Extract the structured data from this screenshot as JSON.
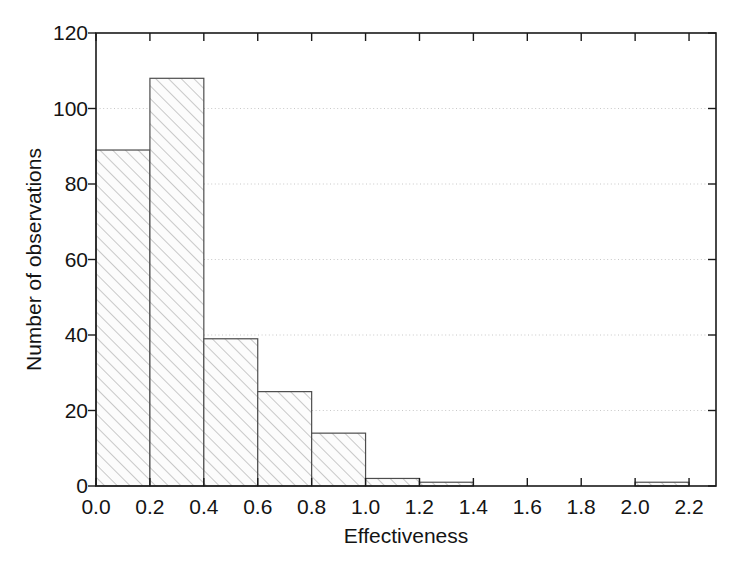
{
  "chart_data": {
    "type": "bar",
    "title": "",
    "subtitle": "",
    "xlabel": "Effectiveness",
    "ylabel": "Number of observations",
    "categories": [
      "0.0-0.2",
      "0.2-0.4",
      "0.4-0.6",
      "0.6-0.8",
      "0.8-1.0",
      "1.0-1.2",
      "1.2-1.4",
      "1.4-1.6",
      "1.6-1.8",
      "1.8-2.0",
      "2.0-2.2"
    ],
    "bin_edges": [
      0.0,
      0.2,
      0.4,
      0.6,
      0.8,
      1.0,
      1.2,
      1.4,
      1.6,
      1.8,
      2.0,
      2.2
    ],
    "bin_width": 0.2,
    "values": [
      89,
      108,
      39,
      25,
      14,
      2,
      1,
      0,
      0,
      0,
      1
    ],
    "xlim": [
      0.0,
      2.3
    ],
    "ylim": [
      0,
      120
    ],
    "xticks": [
      0.0,
      0.2,
      0.4,
      0.6,
      0.8,
      1.0,
      1.2,
      1.4,
      1.6,
      1.8,
      2.0,
      2.2
    ],
    "xtick_labels": [
      "0.0",
      "0.2",
      "0.4",
      "0.6",
      "0.8",
      "1.0",
      "1.2",
      "1.4",
      "1.6",
      "1.8",
      "2.0",
      "2.2"
    ],
    "yticks": [
      0,
      20,
      40,
      60,
      80,
      100,
      120
    ],
    "ytick_labels": [
      "0",
      "20",
      "40",
      "60",
      "80",
      "100",
      "120"
    ],
    "grid": "horizontal-dotted",
    "legend": "none",
    "bar_fill": "#fbfbfb",
    "bar_hatch": "diagonal-forward",
    "bar_hatch_color": "#9a9a9a",
    "bar_edge_color": "#4d4d4d",
    "axis_color": "#1a1a1a",
    "grid_color": "#c8c8c8",
    "background": "#ffffff"
  }
}
